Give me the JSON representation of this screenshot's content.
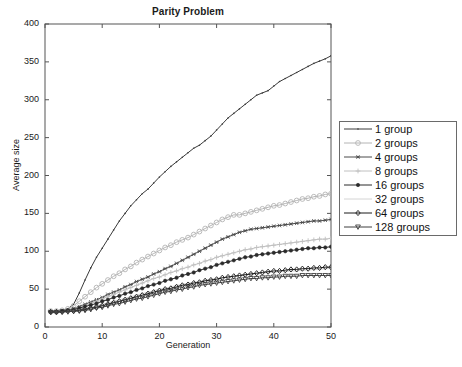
{
  "chart_data": {
    "type": "line",
    "title": "Parity Problem",
    "xlabel": "Generation",
    "ylabel": "Average size",
    "xlim": [
      0,
      50
    ],
    "ylim": [
      0,
      400
    ],
    "xticks": [
      0,
      10,
      20,
      30,
      40,
      50
    ],
    "yticks": [
      0,
      50,
      100,
      150,
      200,
      250,
      300,
      350,
      400
    ],
    "grid": false,
    "legend_position": "right-outside",
    "x": [
      1,
      2,
      3,
      4,
      5,
      6,
      7,
      8,
      9,
      10,
      11,
      12,
      13,
      14,
      15,
      16,
      17,
      18,
      19,
      20,
      21,
      22,
      23,
      24,
      25,
      26,
      27,
      28,
      29,
      30,
      31,
      32,
      33,
      34,
      35,
      36,
      37,
      38,
      39,
      40,
      41,
      42,
      43,
      44,
      45,
      46,
      47,
      48,
      49,
      50
    ],
    "series": [
      {
        "name": "1 group",
        "marker": "point",
        "color": "#3a3a3a",
        "values": [
          21,
          21,
          22,
          24,
          30,
          45,
          62,
          78,
          92,
          104,
          116,
          128,
          140,
          150,
          160,
          168,
          176,
          182,
          190,
          198,
          205,
          212,
          218,
          224,
          230,
          236,
          240,
          246,
          252,
          260,
          268,
          276,
          282,
          288,
          294,
          300,
          306,
          309,
          312,
          318,
          324,
          328,
          332,
          336,
          340,
          344,
          348,
          351,
          354,
          358
        ]
      },
      {
        "name": "2 groups",
        "marker": "circle",
        "color": "#b4b4b4",
        "values": [
          21,
          21,
          22,
          24,
          28,
          34,
          40,
          46,
          52,
          57,
          62,
          67,
          71,
          76,
          80,
          85,
          89,
          93,
          97,
          101,
          105,
          108,
          112,
          115,
          118,
          122,
          126,
          130,
          134,
          138,
          142,
          145,
          148,
          148,
          150,
          152,
          154,
          156,
          158,
          160,
          161,
          163,
          165,
          167,
          169,
          170,
          172,
          173,
          175,
          176
        ]
      },
      {
        "name": "4 groups",
        "marker": "asterisk",
        "color": "#4a4a4a",
        "values": [
          20,
          20,
          21,
          22,
          24,
          27,
          30,
          33,
          36,
          39,
          43,
          46,
          49,
          53,
          56,
          60,
          63,
          66,
          70,
          73,
          77,
          80,
          84,
          88,
          92,
          96,
          100,
          104,
          108,
          112,
          116,
          119,
          122,
          125,
          127,
          129,
          130,
          131,
          132,
          133,
          134,
          135,
          136,
          137,
          138,
          139,
          140,
          140,
          141,
          142
        ]
      },
      {
        "name": "8 groups",
        "marker": "plus",
        "color": "#c0c0c0",
        "values": [
          20,
          20,
          21,
          22,
          24,
          26,
          28,
          31,
          34,
          37,
          40,
          43,
          46,
          49,
          52,
          55,
          58,
          61,
          64,
          66,
          69,
          72,
          74,
          77,
          79,
          82,
          84,
          87,
          89,
          92,
          94,
          96,
          98,
          100,
          102,
          103,
          105,
          106,
          107,
          108,
          109,
          110,
          111,
          112,
          113,
          114,
          115,
          116,
          116,
          117
        ]
      },
      {
        "name": "16 groups",
        "marker": "filled-dot",
        "color": "#2b2b2b",
        "values": [
          20,
          20,
          21,
          22,
          23,
          25,
          27,
          29,
          31,
          34,
          36,
          39,
          41,
          44,
          46,
          49,
          51,
          54,
          56,
          58,
          61,
          63,
          65,
          68,
          70,
          72,
          75,
          77,
          79,
          82,
          84,
          86,
          88,
          90,
          92,
          93,
          95,
          96,
          97,
          98,
          99,
          100,
          101,
          102,
          103,
          104,
          104,
          105,
          105,
          106
        ]
      },
      {
        "name": "32 groups",
        "marker": "none",
        "color": "#d4d4d4",
        "values": [
          20,
          20,
          20,
          21,
          22,
          23,
          25,
          26,
          28,
          30,
          32,
          34,
          36,
          38,
          40,
          42,
          44,
          46,
          48,
          50,
          51,
          53,
          55,
          56,
          58,
          59,
          60,
          62,
          63,
          64,
          65,
          66,
          67,
          68,
          69,
          70,
          70,
          71,
          72,
          72,
          73,
          73,
          74,
          74,
          75,
          75,
          76,
          76,
          77,
          77
        ]
      },
      {
        "name": "64 groups",
        "marker": "diamond",
        "color": "#1a1a1a",
        "values": [
          20,
          20,
          20,
          21,
          21,
          22,
          23,
          25,
          26,
          28,
          30,
          32,
          34,
          36,
          38,
          40,
          42,
          44,
          46,
          48,
          50,
          51,
          53,
          55,
          56,
          58,
          59,
          61,
          62,
          63,
          65,
          66,
          67,
          68,
          69,
          70,
          71,
          72,
          73,
          74,
          74,
          75,
          76,
          76,
          77,
          77,
          78,
          78,
          79,
          79
        ]
      },
      {
        "name": "128 groups",
        "marker": "triangle-down",
        "color": "#3f3f3f",
        "values": [
          19,
          19,
          20,
          20,
          21,
          21,
          22,
          23,
          25,
          26,
          28,
          30,
          31,
          33,
          35,
          37,
          38,
          40,
          42,
          44,
          46,
          47,
          49,
          50,
          52,
          53,
          55,
          56,
          57,
          58,
          59,
          60,
          61,
          62,
          63,
          64,
          64,
          65,
          65,
          66,
          66,
          67,
          67,
          67,
          68,
          68,
          68,
          68,
          68,
          68
        ]
      }
    ]
  },
  "legend": {
    "items": [
      {
        "label": "1 group"
      },
      {
        "label": "2 groups"
      },
      {
        "label": "4 groups"
      },
      {
        "label": "8 groups"
      },
      {
        "label": "16 groups"
      },
      {
        "label": "32 groups"
      },
      {
        "label": "64 groups"
      },
      {
        "label": "128 groups"
      }
    ]
  }
}
